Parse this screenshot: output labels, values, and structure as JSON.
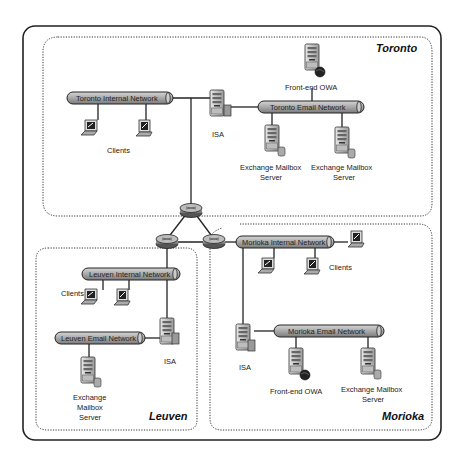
{
  "diagram": {
    "sites": [
      {
        "name": "Toronto"
      },
      {
        "name": "Leuven"
      },
      {
        "name": "Morioka"
      }
    ],
    "toronto": {
      "internal_network": "Toronto Internal Network",
      "email_network": "Toronto Email Network",
      "clients_label": "Clients",
      "isa_label": "ISA",
      "owa_label": "Front-end OWA",
      "mailbox1_line1": "Exchange Mailbox",
      "mailbox1_line2": "Server",
      "mailbox2_line1": "Exchange Mailbox",
      "mailbox2_line2": "Server"
    },
    "leuven": {
      "internal_network": "Leuven Internal Network",
      "email_network": "Leuven Email Network",
      "clients_label": "Clients",
      "isa_label": "ISA",
      "mailbox_line1": "Exchange",
      "mailbox_line2": "Mailbox",
      "mailbox_line3": "Server"
    },
    "morioka": {
      "internal_network": "Morioka Internal Network",
      "email_network": "Morioka Email Network",
      "clients_label": "Clients",
      "isa_label": "ISA",
      "owa_label": "Front-end OWA",
      "mailbox_line1": "Exchange Mailbox",
      "mailbox_line2": "Server"
    },
    "routers": [
      "router-toronto",
      "router-leuven",
      "router-morioka"
    ],
    "colors": {
      "pipe_fill": "#a8a8a8",
      "line": "#222222",
      "server": "#c8c8c8"
    }
  }
}
